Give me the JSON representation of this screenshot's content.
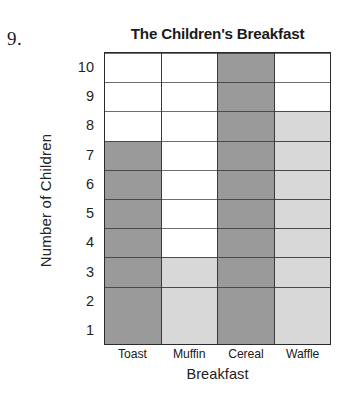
{
  "question_number": "9.",
  "chart_data": {
    "type": "bar",
    "title": "The Children's Breakfast",
    "xlabel": "Breakfast",
    "ylabel": "Number of Children",
    "categories": [
      "Toast",
      "Muffin",
      "Cereal",
      "Waffle"
    ],
    "values": [
      7,
      3,
      10,
      8
    ],
    "bar_colors": [
      "#9a9a9a",
      "#d8d8d8",
      "#9a9a9a",
      "#d8d8d8"
    ],
    "ylim": [
      0,
      10
    ],
    "yticks": [
      1,
      2,
      3,
      4,
      5,
      6,
      7,
      8,
      9,
      10
    ],
    "ytick_labels": [
      "1",
      "2",
      "3",
      "4",
      "5",
      "6",
      "7",
      "8",
      "9",
      "10"
    ],
    "grid": true,
    "legend": false,
    "style": "grid-cell-bar",
    "colors": {
      "dark_fill": "#9a9a9a",
      "light_fill": "#d8d8d8",
      "empty_fill": "#ffffff",
      "grid_line": "#6e6e6e",
      "axis_line": "#2b2b2b",
      "text": "#1f1f1f"
    }
  }
}
